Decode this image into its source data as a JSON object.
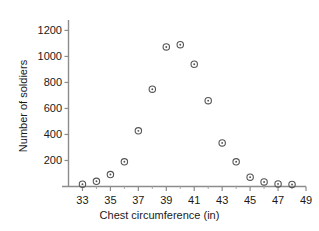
{
  "chart_data": {
    "type": "scatter",
    "title": "",
    "xlabel": "Chest circumference (in)",
    "ylabel": "Number of soldiers",
    "x": [
      33,
      34,
      35,
      36,
      37,
      38,
      39,
      40,
      41,
      42,
      43,
      44,
      45,
      46,
      47,
      48
    ],
    "values": [
      18,
      40,
      92,
      190,
      428,
      748,
      1073,
      1090,
      940,
      660,
      335,
      190,
      72,
      35,
      20,
      16
    ],
    "series": [
      {
        "name": "Number of soldiers",
        "values": [
          18,
          40,
          92,
          190,
          428,
          748,
          1073,
          1090,
          940,
          660,
          335,
          190,
          72,
          35,
          20,
          16
        ]
      }
    ],
    "xlim": [
      32,
      49
    ],
    "ylim": [
      0,
      1280
    ],
    "x_ticks": [
      33,
      35,
      37,
      39,
      41,
      43,
      45,
      47,
      49
    ],
    "x_tick_labels": [
      "33",
      "35",
      "37",
      "39",
      "41",
      "43",
      "45",
      "47",
      "49"
    ],
    "x_minor_ticks": [
      34,
      36,
      38,
      40,
      42,
      44,
      46,
      48
    ],
    "y_ticks": [
      200,
      400,
      600,
      800,
      1000,
      1200
    ],
    "y_tick_labels": [
      "200",
      "400",
      "600",
      "800",
      "1000",
      "1200"
    ],
    "grid": false,
    "legend": "none",
    "marker": "circle-with-center-dot",
    "marker_color": "#555555",
    "axis_color": "#808080"
  },
  "axes": {
    "x_title": "Chest circumference (in)",
    "y_title": "Number of soldiers"
  }
}
